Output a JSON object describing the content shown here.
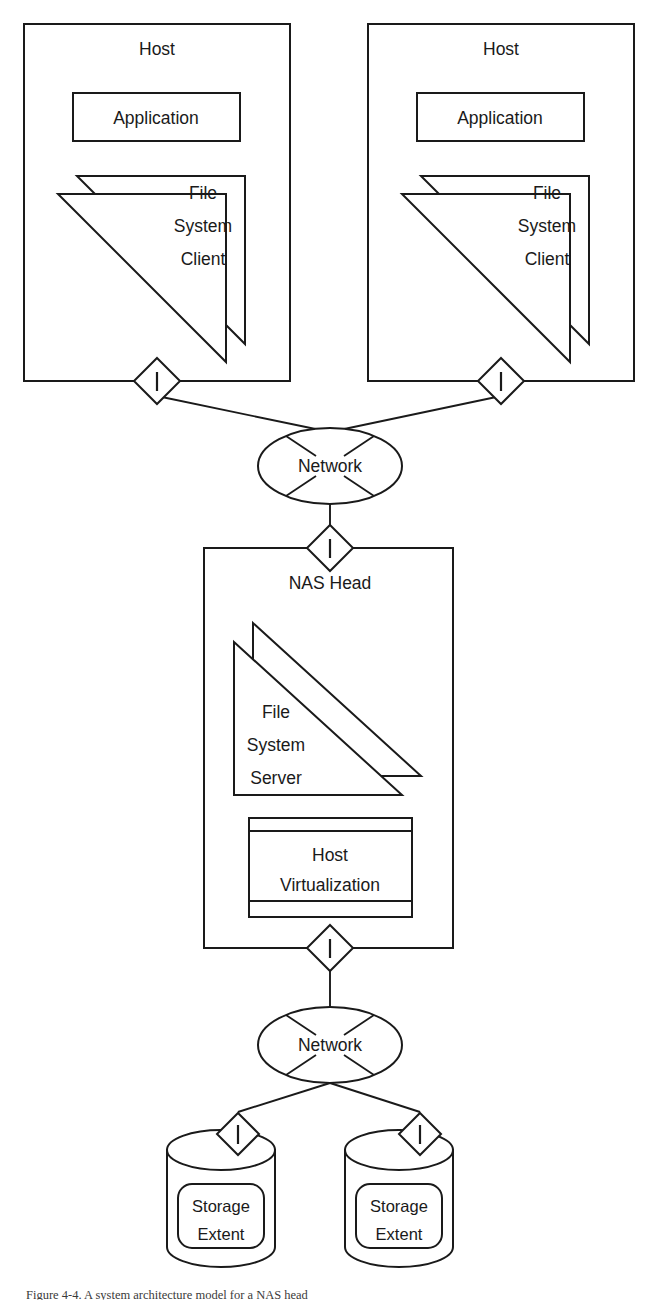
{
  "diagram": {
    "type": "block-diagram",
    "background_color": "#ffffff",
    "line_color": "#1a1a1a",
    "caption": "Figure 4-4. A system architecture model for a NAS head",
    "hosts": [
      {
        "id": "host-left",
        "label": "Host",
        "application_label": "Application",
        "stack_label_lines": [
          "File",
          "System",
          "Client"
        ],
        "connector_label": "I"
      },
      {
        "id": "host-right",
        "label": "Host",
        "application_label": "Application",
        "stack_label_lines": [
          "File",
          "System",
          "Client"
        ],
        "connector_label": "I"
      }
    ],
    "networks": [
      {
        "id": "network-top",
        "label": "Network",
        "spokes": 4
      },
      {
        "id": "network-bottom",
        "label": "Network",
        "spokes": 4
      }
    ],
    "nas_head": {
      "label": "NAS Head",
      "connector_label_top": "I",
      "connector_label_bottom": "I",
      "file_system_server_lines": [
        "File",
        "System",
        "Server"
      ],
      "host_virtualization_lines": [
        "Host",
        "Virtualization"
      ]
    },
    "storage_extents": [
      {
        "id": "storage-extent-left",
        "label_lines": [
          "Storage",
          "Extent"
        ],
        "connector_label": "I"
      },
      {
        "id": "storage-extent-right",
        "label_lines": [
          "Storage",
          "Extent"
        ],
        "connector_label": "I"
      }
    ]
  }
}
